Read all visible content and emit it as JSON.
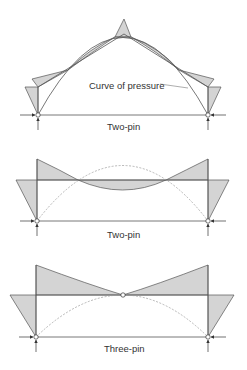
{
  "diagrams": [
    {
      "id": "portal-two-pin-pitched",
      "caption": "Two-pin",
      "annotation": "Curve of pressure"
    },
    {
      "id": "portal-two-pin-flat",
      "caption": "Two-pin"
    },
    {
      "id": "portal-three-pin-flat",
      "caption": "Three-pin"
    }
  ],
  "colors": {
    "line": "#555555",
    "fill": "#d4d4d4",
    "dashed": "#9a9a9a",
    "text": "#333333"
  }
}
